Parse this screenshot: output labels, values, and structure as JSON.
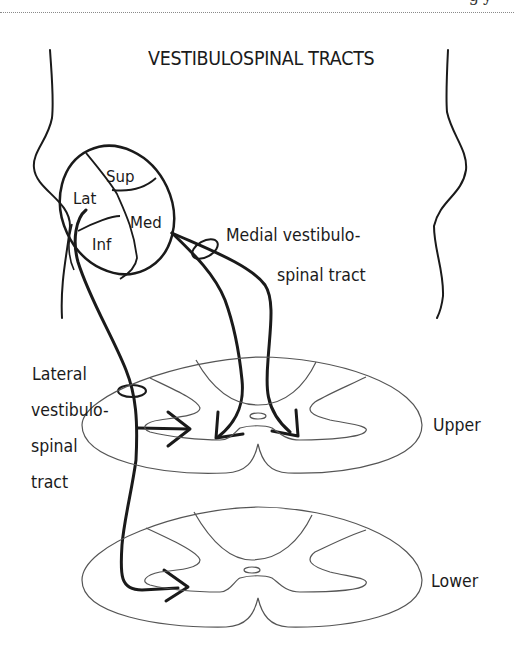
{
  "page_header": {
    "partial_text": "gy"
  },
  "figure": {
    "title": "VESTIBULOSPINAL TRACTS",
    "nuclei": {
      "superior": "Sup",
      "lateral": "Lat",
      "medial": "Med",
      "inferior": "Inf"
    },
    "tracts": {
      "medial": {
        "line1": "Medial vestibulo-",
        "line2": "spinal tract"
      },
      "lateral": {
        "line1": "Lateral",
        "line2": "vestibulo-",
        "line3": "spinal",
        "line4": "tract"
      }
    },
    "cord_levels": {
      "upper": "Upper",
      "lower": "Lower"
    },
    "colors": {
      "ink": "#1a1a1a",
      "cord_outline": "#555555",
      "background": "#ffffff"
    }
  }
}
